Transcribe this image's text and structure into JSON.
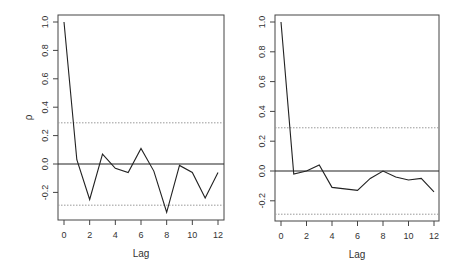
{
  "chart_data": [
    {
      "type": "line",
      "title": "",
      "xlabel": "Lag",
      "ylabel": "ρ",
      "x": [
        0,
        1,
        2,
        3,
        4,
        5,
        6,
        7,
        8,
        9,
        10,
        11,
        12
      ],
      "series": [
        {
          "name": "ACF",
          "values": [
            1.0,
            0.03,
            -0.25,
            0.07,
            -0.03,
            -0.06,
            0.11,
            -0.05,
            -0.34,
            -0.01,
            -0.06,
            -0.24,
            -0.06
          ]
        }
      ],
      "confidence_bounds": [
        0.29,
        -0.29
      ],
      "zero_line": 0,
      "xticks": [
        "0",
        "2",
        "4",
        "6",
        "8",
        "10",
        "12"
      ],
      "yticks": [
        "-0.2",
        "0.0",
        "0.2",
        "0.4",
        "0.6",
        "0.8",
        "1.0"
      ],
      "xlim": [
        0,
        12
      ],
      "ylim": [
        -0.36,
        1.0
      ],
      "grid": false,
      "legend": null
    },
    {
      "type": "line",
      "title": "",
      "xlabel": "Lag",
      "ylabel": "",
      "x": [
        0,
        1,
        2,
        3,
        4,
        5,
        6,
        7,
        8,
        9,
        10,
        11,
        12
      ],
      "series": [
        {
          "name": "ACF",
          "values": [
            1.0,
            -0.02,
            0.0,
            0.04,
            -0.11,
            -0.12,
            -0.13,
            -0.05,
            0.0,
            -0.04,
            -0.06,
            -0.05,
            -0.14
          ]
        }
      ],
      "confidence_bounds": [
        0.29,
        -0.29
      ],
      "zero_line": 0,
      "xticks": [
        "0",
        "2",
        "4",
        "6",
        "8",
        "10",
        "12"
      ],
      "yticks": [
        "-0.2",
        "0.0",
        "0.2",
        "0.4",
        "0.6",
        "0.8",
        "1.0"
      ],
      "xlim": [
        0,
        12
      ],
      "ylim": [
        -0.33,
        1.0
      ],
      "grid": false,
      "legend": null
    }
  ]
}
